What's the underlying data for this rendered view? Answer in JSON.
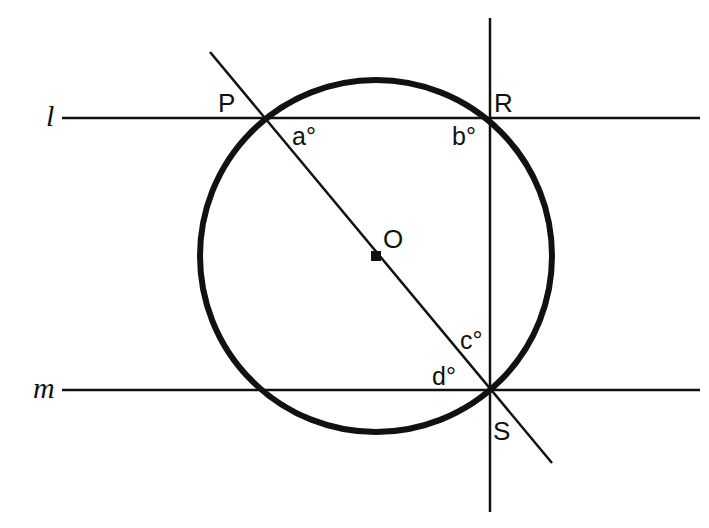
{
  "figure": {
    "background_color": "#ffffff",
    "stroke_color": "#111111",
    "width": 709,
    "height": 528
  },
  "circle": {
    "center_label": "O",
    "center": {
      "x": 376,
      "y": 256
    },
    "radius": 176,
    "stroke_width": 6
  },
  "lines": {
    "l": {
      "label": "l",
      "label_x": 46,
      "label_y": 126,
      "y": 118,
      "x1": 62,
      "x2": 700,
      "stroke_width": 2.5
    },
    "m": {
      "label": "m",
      "label_x": 33,
      "label_y": 398,
      "y": 390,
      "x1": 62,
      "x2": 700,
      "stroke_width": 2.5
    },
    "vertical": {
      "label": "",
      "x": 490,
      "y1": 18,
      "y2": 512,
      "stroke_width": 2.5
    },
    "diagonal": {
      "label": "",
      "x1": 210,
      "y1": 52,
      "x2": 552,
      "y2": 463,
      "stroke_width": 2.5
    }
  },
  "points": [
    {
      "name": "P",
      "label": "P",
      "x": 262,
      "y": 120,
      "label_x": 218,
      "label_y": 112
    },
    {
      "name": "R",
      "label": "R",
      "x": 490,
      "y": 118,
      "label_x": 494,
      "label_y": 112
    },
    {
      "name": "O",
      "label": "O",
      "x": 376,
      "y": 256,
      "label_x": 383,
      "label_y": 248
    },
    {
      "name": "S",
      "label": "S",
      "x": 490,
      "y": 390,
      "label_x": 493,
      "label_y": 440
    }
  ],
  "angles": [
    {
      "name": "a",
      "label": "a°",
      "x": 292,
      "y": 145
    },
    {
      "name": "b",
      "label": "b°",
      "x": 452,
      "y": 145
    },
    {
      "name": "c",
      "label": "c°",
      "x": 460,
      "y": 349
    },
    {
      "name": "d",
      "label": "d°",
      "x": 432,
      "y": 385
    }
  ]
}
